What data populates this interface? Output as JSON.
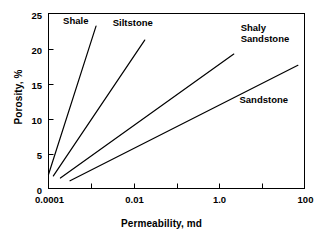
{
  "chart_data": {
    "type": "line",
    "title": "",
    "xlabel": "Permeability, md",
    "ylabel": "Porosity, %",
    "xscale": "log",
    "yscale": "linear",
    "xlim": [
      0.0001,
      100
    ],
    "ylim": [
      0,
      25
    ],
    "grid": false,
    "legend_position": "inline-annotations",
    "xticks": [
      {
        "value": 0.0001,
        "label": "0.0001"
      },
      {
        "value": 0.001,
        "label": ""
      },
      {
        "value": 0.01,
        "label": "0.01"
      },
      {
        "value": 0.1,
        "label": ""
      },
      {
        "value": 1.0,
        "label": "1.0"
      },
      {
        "value": 10,
        "label": ""
      },
      {
        "value": 100,
        "label": "100"
      }
    ],
    "yticks": [
      {
        "value": 0,
        "label": "0"
      },
      {
        "value": 5,
        "label": "5"
      },
      {
        "value": 10,
        "label": "10"
      },
      {
        "value": 15,
        "label": "15"
      },
      {
        "value": 20,
        "label": "20"
      },
      {
        "value": 25,
        "label": "25"
      }
    ],
    "series": [
      {
        "name": "Shale",
        "color": "#000000",
        "points": [
          {
            "x": 0.0001,
            "y": 2.0
          },
          {
            "x": 0.0013,
            "y": 23.2
          }
        ],
        "label": "Shale",
        "label_x": 0.00022,
        "label_y": 24.0
      },
      {
        "name": "Siltstone",
        "color": "#000000",
        "points": [
          {
            "x": 0.00013,
            "y": 1.8
          },
          {
            "x": 0.018,
            "y": 21.2
          }
        ],
        "label": "Siltstone",
        "label_x": 0.0032,
        "label_y": 23.6
      },
      {
        "name": "Shaly Sandstone",
        "color": "#000000",
        "points": [
          {
            "x": 0.00019,
            "y": 1.5
          },
          {
            "x": 2.2,
            "y": 19.2
          }
        ],
        "label": "Shaly\nSandstone",
        "label_x": 3.2,
        "label_y": 23.0
      },
      {
        "name": "Sandstone",
        "color": "#000000",
        "points": [
          {
            "x": 0.00032,
            "y": 1.1
          },
          {
            "x": 70,
            "y": 17.6
          }
        ],
        "label": "Sandstone",
        "label_x": 3.0,
        "label_y": 12.6
      }
    ]
  },
  "axes": {
    "frame_color": "#000000",
    "background": "#ffffff",
    "line_color": "#000000"
  }
}
